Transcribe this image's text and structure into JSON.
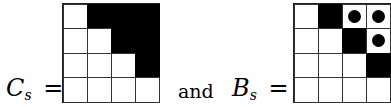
{
  "left": {
    "symbol": "C",
    "subscript": "s",
    "equals": "=",
    "grid": [
      [
        "white",
        "black",
        "black",
        "black"
      ],
      [
        "white",
        "white",
        "black",
        "black"
      ],
      [
        "white",
        "white",
        "white",
        "black"
      ],
      [
        "white",
        "white",
        "white",
        "white"
      ]
    ]
  },
  "connector": "and",
  "right": {
    "symbol": "B",
    "subscript": "s",
    "equals": "=",
    "grid": [
      [
        "white",
        "black",
        "dot",
        "dot"
      ],
      [
        "white",
        "white",
        "black",
        "dot"
      ],
      [
        "white",
        "white",
        "white",
        "black"
      ],
      [
        "white",
        "white",
        "white",
        "white"
      ]
    ]
  },
  "legend": {
    "white": "empty cell",
    "black": "filled cell",
    "dot": "cell with dot"
  }
}
